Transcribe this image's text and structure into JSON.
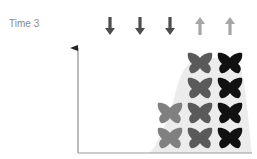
{
  "title": "Time 3",
  "colors": {
    "arrow_down": "#4d4d4d",
    "arrow_up": "#a6a6a6",
    "axis": "#777777",
    "hump": "#ececec",
    "butterfly_light": "#808080",
    "butterfly_medium": "#5a5a5a",
    "butterfly_dark": "#111111"
  },
  "arrows": [
    {
      "direction": "down",
      "shade": "dark"
    },
    {
      "direction": "down",
      "shade": "dark"
    },
    {
      "direction": "down",
      "shade": "dark"
    },
    {
      "direction": "up",
      "shade": "light"
    },
    {
      "direction": "up",
      "shade": "light"
    }
  ],
  "butterfly_columns": [
    {
      "shade": "light",
      "count": 2
    },
    {
      "shade": "medium",
      "count": 4
    },
    {
      "shade": "dark",
      "count": 4
    }
  ]
}
